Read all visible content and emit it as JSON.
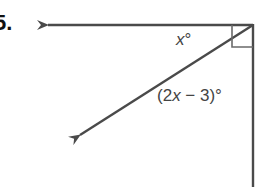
{
  "problem": {
    "number": "5."
  },
  "diagram": {
    "vertex": [
      253,
      25
    ],
    "rays": [
      {
        "name": "horizontal-ray",
        "from": [
          253,
          25
        ],
        "to": [
          46,
          25
        ]
      },
      {
        "name": "diagonal-ray",
        "from": [
          253,
          25
        ],
        "to": [
          78,
          136
        ]
      },
      {
        "name": "vertical-ray",
        "from": [
          253,
          25
        ],
        "to": [
          253,
          187
        ]
      }
    ],
    "right_angle_marker": {
      "size": 21
    },
    "line_color": "#4a4a4a"
  },
  "labels": {
    "angle_top": {
      "var": "x",
      "suffix": "°"
    },
    "angle_bottom": {
      "prefix": "(2",
      "var": "x",
      "suffix": " − 3)°"
    }
  }
}
